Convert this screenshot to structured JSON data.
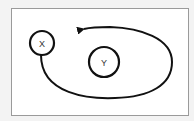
{
  "diagram": {
    "nodes": [
      {
        "id": "x",
        "label": "X"
      },
      {
        "id": "y",
        "label": "Y"
      }
    ],
    "edges": [
      {
        "from": "X",
        "to": "around Y (loop, arrow pointing left at top)"
      }
    ],
    "colors": {
      "background": "#f3f3f3",
      "frame_fill": "#ffffff",
      "frame_border": "#9a9a9a",
      "stroke": "#111111"
    }
  }
}
